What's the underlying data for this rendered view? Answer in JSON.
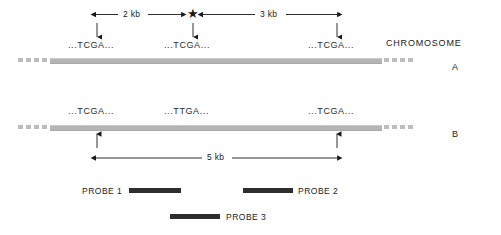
{
  "figure": {
    "colors": {
      "chromosome": "#b5b5b5",
      "probe": "#2e2e2e",
      "ink": "#1a1a1a"
    }
  },
  "legend": {
    "chromosome_heading": "CHROMOSOME",
    "chromosome_a": "A",
    "chromosome_b": "B"
  },
  "measurements": {
    "left_span": "2 kb",
    "right_span": "3 kb",
    "total_span": "5 kb"
  },
  "marker": {
    "mutation_star": "★"
  },
  "chromosome_a": {
    "sites": [
      {
        "sequence": "...TCGA...",
        "x": 97
      },
      {
        "sequence": "...TCGA...",
        "x": 193
      },
      {
        "sequence": "...TCGA...",
        "x": 337
      }
    ]
  },
  "chromosome_b": {
    "sites": [
      {
        "sequence": "...TCGA...",
        "x": 97
      },
      {
        "sequence": "...TTGA...",
        "x": 193
      },
      {
        "sequence": "...TCGA...",
        "x": 337
      }
    ]
  },
  "probes": [
    {
      "label": "PROBE 1",
      "label_side": "left"
    },
    {
      "label": "PROBE 2",
      "label_side": "right"
    },
    {
      "label": "PROBE 3",
      "label_side": "right"
    }
  ]
}
